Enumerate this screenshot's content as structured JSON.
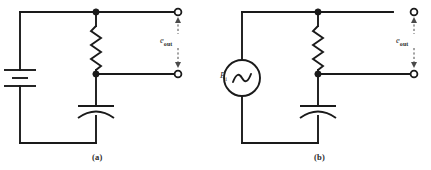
{
  "figure": {
    "background_color": "#ffffff",
    "line_color": "#1a1a1a",
    "dimensions": {
      "width": 431,
      "height": 170
    }
  },
  "circuits": [
    {
      "id": "circuit-a",
      "caption": "(a)",
      "source": {
        "type": "battery",
        "label": ""
      },
      "components": [
        {
          "type": "resistor",
          "label": ""
        },
        {
          "type": "capacitor",
          "label": ""
        }
      ],
      "output": {
        "label_main": "e",
        "label_sub": "out",
        "terminals": 2,
        "terminal_style": "open-circle"
      }
    },
    {
      "id": "circuit-b",
      "caption": "(b)",
      "source": {
        "type": "ac-source",
        "label_main": "E",
        "label_sub": "i"
      },
      "components": [
        {
          "type": "resistor",
          "label": ""
        },
        {
          "type": "capacitor",
          "label": ""
        }
      ],
      "output": {
        "label_main": "e",
        "label_sub": "out",
        "terminals": 2,
        "terminal_style": "open-circle"
      }
    }
  ]
}
